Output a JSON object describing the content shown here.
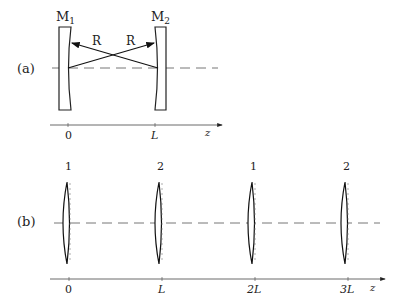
{
  "panel_a": {
    "label": "(a)",
    "mirror1": {
      "name": "M",
      "sub": "1"
    },
    "mirror2": {
      "name": "M",
      "sub": "2"
    },
    "ray_label_left": "R",
    "ray_label_right": "R",
    "axis": {
      "ticks": [
        "0",
        "L"
      ],
      "var": "z"
    }
  },
  "panel_b": {
    "label": "(b)",
    "lenses": [
      "1",
      "2",
      "1",
      "2"
    ],
    "axis": {
      "ticks": [
        "0",
        "L",
        "2L",
        "3L"
      ],
      "var": "z"
    }
  }
}
